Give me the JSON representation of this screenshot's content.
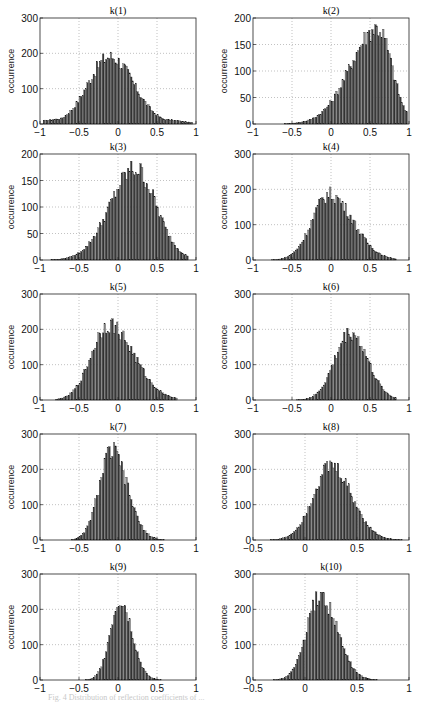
{
  "figure": {
    "caption": "Fig. 4 Distribution of reflection coefficients of ..."
  },
  "chart_data": [
    {
      "type": "bar",
      "title": "k(1)",
      "xlabel": "",
      "ylabel": "occurrence",
      "xlim": [
        -1,
        1
      ],
      "ylim": [
        0,
        300
      ],
      "xticks": [
        -1,
        -0.5,
        0,
        0.5,
        1
      ],
      "yticks": [
        0,
        100,
        200,
        300
      ],
      "grid": true,
      "shape": {
        "center": -0.1,
        "peak": 205,
        "sigma_left": 0.28,
        "sigma_right": 0.3,
        "floor": 35,
        "support": [
          -0.95,
          0.95
        ]
      }
    },
    {
      "type": "bar",
      "title": "k(2)",
      "xlabel": "",
      "ylabel": "occurrence",
      "xlim": [
        -1,
        1
      ],
      "ylim": [
        0,
        200
      ],
      "xticks": [
        -1,
        -0.5,
        0,
        0.5,
        1
      ],
      "yticks": [
        0,
        50,
        100,
        150,
        200
      ],
      "grid": true,
      "shape": {
        "center": 0.6,
        "peak": 195,
        "sigma_left": 0.35,
        "sigma_right": 0.18,
        "floor": 0,
        "support": [
          -0.6,
          0.98
        ]
      }
    },
    {
      "type": "bar",
      "title": "k(3)",
      "xlabel": "",
      "ylabel": "occurrence",
      "xlim": [
        -1,
        1
      ],
      "ylim": [
        0,
        200
      ],
      "xticks": [
        -1,
        -0.5,
        0,
        0.5,
        1
      ],
      "yticks": [
        0,
        50,
        100,
        150,
        200
      ],
      "grid": true,
      "shape": {
        "center": 0.22,
        "peak": 185,
        "sigma_left": 0.32,
        "sigma_right": 0.27,
        "floor": 0,
        "support": [
          -0.85,
          0.9
        ]
      }
    },
    {
      "type": "bar",
      "title": "k(4)",
      "xlabel": "",
      "ylabel": "occurrence",
      "xlim": [
        -1,
        1
      ],
      "ylim": [
        0,
        300
      ],
      "xticks": [
        -1,
        -0.5,
        0,
        0.5,
        1
      ],
      "yticks": [
        0,
        100,
        200,
        300
      ],
      "grid": true,
      "shape": {
        "center": -0.02,
        "peak": 200,
        "sigma_left": 0.22,
        "sigma_right": 0.3,
        "floor": 0,
        "support": [
          -0.75,
          0.85
        ]
      }
    },
    {
      "type": "bar",
      "title": "k(5)",
      "xlabel": "",
      "ylabel": "occurrence",
      "xlim": [
        -1,
        1
      ],
      "ylim": [
        0,
        300
      ],
      "xticks": [
        -1,
        -0.5,
        0,
        0.5,
        1
      ],
      "yticks": [
        0,
        100,
        200,
        300
      ],
      "grid": true,
      "shape": {
        "center": -0.12,
        "peak": 230,
        "sigma_left": 0.22,
        "sigma_right": 0.32,
        "floor": 0,
        "support": [
          -0.8,
          0.75
        ]
      }
    },
    {
      "type": "bar",
      "title": "k(6)",
      "xlabel": "",
      "ylabel": "occurrence",
      "xlim": [
        -1,
        1
      ],
      "ylim": [
        0,
        300
      ],
      "xticks": [
        -1,
        -0.5,
        0,
        0.5,
        1
      ],
      "yticks": [
        0,
        100,
        200,
        300
      ],
      "grid": true,
      "shape": {
        "center": 0.25,
        "peak": 205,
        "sigma_left": 0.2,
        "sigma_right": 0.22,
        "floor": 0,
        "support": [
          -0.5,
          0.85
        ]
      }
    },
    {
      "type": "bar",
      "title": "k(7)",
      "xlabel": "",
      "ylabel": "occurrence",
      "xlim": [
        -1,
        1
      ],
      "ylim": [
        0,
        300
      ],
      "xticks": [
        -1,
        -0.5,
        0,
        0.5,
        1
      ],
      "yticks": [
        0,
        100,
        200,
        300
      ],
      "grid": true,
      "shape": {
        "center": -0.08,
        "peak": 270,
        "sigma_left": 0.16,
        "sigma_right": 0.2,
        "floor": 0,
        "support": [
          -0.6,
          0.6
        ]
      }
    },
    {
      "type": "bar",
      "title": "k(8)",
      "xlabel": "",
      "ylabel": "occurrence",
      "xlim": [
        -0.5,
        1
      ],
      "ylim": [
        0,
        300
      ],
      "xticks": [
        -0.5,
        0,
        0.5,
        1
      ],
      "yticks": [
        0,
        100,
        200,
        300
      ],
      "grid": true,
      "shape": {
        "center": 0.25,
        "peak": 225,
        "sigma_left": 0.17,
        "sigma_right": 0.2,
        "floor": 0,
        "support": [
          -0.4,
          0.95
        ]
      }
    },
    {
      "type": "bar",
      "title": "k(9)",
      "xlabel": "",
      "ylabel": "occurrence",
      "xlim": [
        -1,
        1
      ],
      "ylim": [
        0,
        300
      ],
      "xticks": [
        -1,
        -0.5,
        0,
        0.5,
        1
      ],
      "yticks": [
        0,
        100,
        200,
        300
      ],
      "grid": true,
      "shape": {
        "center": 0.03,
        "peak": 245,
        "sigma_left": 0.13,
        "sigma_right": 0.15,
        "floor": 0,
        "support": [
          -0.5,
          0.6
        ]
      }
    },
    {
      "type": "bar",
      "title": "k(10)",
      "xlabel": "",
      "ylabel": "occurrence",
      "xlim": [
        -0.5,
        1
      ],
      "ylim": [
        0,
        300
      ],
      "xticks": [
        -0.5,
        0,
        0.5,
        1
      ],
      "yticks": [
        0,
        100,
        200,
        300
      ],
      "grid": true,
      "shape": {
        "center": 0.15,
        "peak": 255,
        "sigma_left": 0.13,
        "sigma_right": 0.16,
        "floor": 0,
        "support": [
          -0.4,
          0.7
        ]
      }
    }
  ],
  "layout": {
    "panels": [
      {
        "left": 0,
        "top": 4
      },
      {
        "left": 213,
        "top": 4
      },
      {
        "left": 0,
        "top": 140
      },
      {
        "left": 213,
        "top": 140
      },
      {
        "left": 0,
        "top": 280
      },
      {
        "left": 213,
        "top": 280
      },
      {
        "left": 0,
        "top": 420
      },
      {
        "left": 213,
        "top": 420
      },
      {
        "left": 0,
        "top": 560
      },
      {
        "left": 213,
        "top": 560
      }
    ]
  }
}
